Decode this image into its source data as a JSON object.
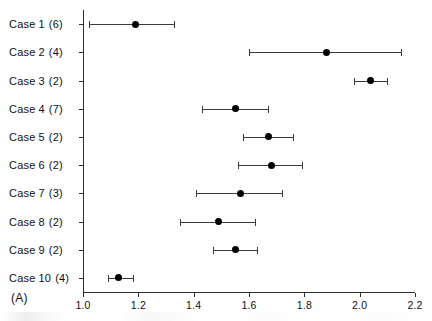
{
  "figure": {
    "panel_label": "(A)",
    "background_color": "#ffffff",
    "marker_color": "#000000",
    "line_color": "#3a3a3a",
    "axis_color": "#2c2c2c"
  },
  "chart_data": {
    "type": "scatter",
    "title": "",
    "subtitle": "",
    "xlabel": "",
    "ylabel": "",
    "xlim": [
      1.0,
      2.2
    ],
    "ylim": [
      0,
      10
    ],
    "grid": false,
    "legend": null,
    "orientation": "horizontal",
    "annotations": [
      "(A)"
    ],
    "xticks": [
      1.0,
      1.2,
      1.4,
      1.6,
      1.8,
      2.0,
      2.2
    ],
    "xtick_labels": [
      "1.0",
      "1.2",
      "1.4",
      "1.6",
      "1.8",
      "2.0",
      "2.2"
    ],
    "categories": [
      "Case 1 (6)",
      "Case 2 (4)",
      "Case 3 (2)",
      "Case 4 (7)",
      "Case 5 (2)",
      "Case 6 (2)",
      "Case 7 (3)",
      "Case 8 (2)",
      "Case 9 (2)",
      "Case 10 (4)"
    ],
    "category_parts": [
      {
        "word": "Case",
        "index": "1",
        "count": "(6)"
      },
      {
        "word": "Case",
        "index": "2",
        "count": "(4)"
      },
      {
        "word": "Case",
        "index": "3",
        "count": "(2)"
      },
      {
        "word": "Case",
        "index": "4",
        "count": "(7)"
      },
      {
        "word": "Case",
        "index": "5",
        "count": "(2)"
      },
      {
        "word": "Case",
        "index": "6",
        "count": "(2)"
      },
      {
        "word": "Case",
        "index": "7",
        "count": "(3)"
      },
      {
        "word": "Case",
        "index": "8",
        "count": "(2)"
      },
      {
        "word": "Case",
        "index": "9",
        "count": "(2)"
      },
      {
        "word": "Case",
        "index": "10",
        "count": "(4)"
      }
    ],
    "values": [
      1.19,
      1.88,
      2.04,
      1.55,
      1.67,
      1.68,
      1.57,
      1.49,
      1.55,
      1.13
    ],
    "error_low": [
      1.02,
      1.6,
      1.98,
      1.43,
      1.58,
      1.56,
      1.41,
      1.35,
      1.47,
      1.09
    ],
    "error_high": [
      1.33,
      2.15,
      2.1,
      1.67,
      1.76,
      1.79,
      1.72,
      1.62,
      1.63,
      1.18
    ],
    "points": [
      {
        "category": "Case 1 (6)",
        "value": 1.19,
        "low": 1.02,
        "high": 1.33
      },
      {
        "category": "Case 2 (4)",
        "value": 1.88,
        "low": 1.6,
        "high": 2.15
      },
      {
        "category": "Case 3 (2)",
        "value": 2.04,
        "low": 1.98,
        "high": 2.1
      },
      {
        "category": "Case 4 (7)",
        "value": 1.55,
        "low": 1.43,
        "high": 1.67
      },
      {
        "category": "Case 5 (2)",
        "value": 1.67,
        "low": 1.58,
        "high": 1.76
      },
      {
        "category": "Case 6 (2)",
        "value": 1.68,
        "low": 1.56,
        "high": 1.79
      },
      {
        "category": "Case 7 (3)",
        "value": 1.57,
        "low": 1.41,
        "high": 1.72
      },
      {
        "category": "Case 8 (2)",
        "value": 1.49,
        "low": 1.35,
        "high": 1.62
      },
      {
        "category": "Case 9 (2)",
        "value": 1.55,
        "low": 1.47,
        "high": 1.63
      },
      {
        "category": "Case 10 (4)",
        "value": 1.13,
        "low": 1.09,
        "high": 1.18
      }
    ]
  }
}
